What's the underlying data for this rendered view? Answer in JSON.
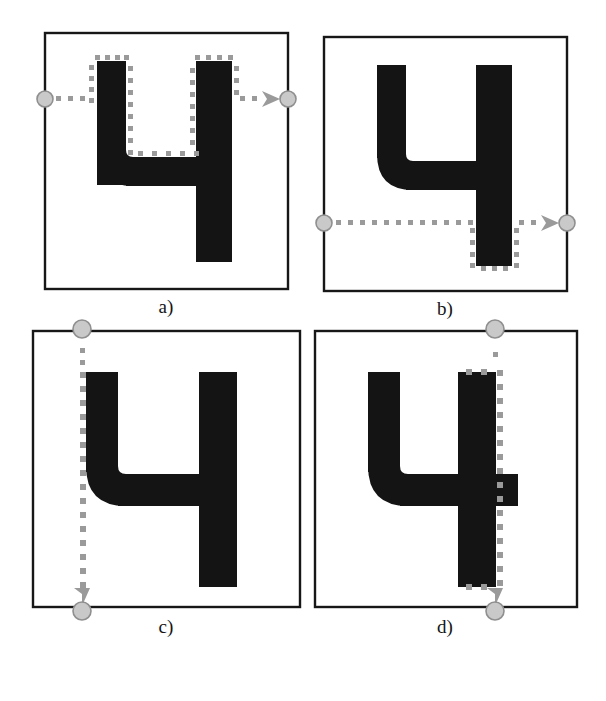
{
  "figure": {
    "type": "multi-panel-diagram",
    "panel_count": 4,
    "colors": {
      "ink": "#141414",
      "box_border": "#171717",
      "trace_dot": "#9a9a9a",
      "marker_fill": "#c9c9c9",
      "marker_stroke": "#8f8f8f",
      "background": "#ffffff"
    }
  },
  "panels": [
    {
      "id": "a",
      "label": "a)",
      "box": {
        "x": 45,
        "y": 33,
        "w": 243,
        "h": 256
      },
      "digit": "4",
      "scan": {
        "orientation": "horizontal",
        "direction": "right",
        "line_y": 99,
        "start_marker": {
          "x": 45,
          "y": 99
        },
        "end_marker": {
          "x": 288,
          "y": 99
        },
        "arrow_at": {
          "x": 272,
          "y": 99
        }
      },
      "contour_dots": "outlines the inner u-shaped cavity of the digit: left stem outer edge, stem top, inner right side, inner bottom, right stem left edge"
    },
    {
      "id": "b",
      "label": "b)",
      "box": {
        "x": 324,
        "y": 37,
        "w": 243,
        "h": 254
      },
      "digit": "4",
      "scan": {
        "orientation": "horizontal",
        "direction": "right",
        "line_y": 223,
        "start_marker": {
          "x": 324,
          "y": 223
        },
        "end_marker": {
          "x": 567,
          "y": 223
        },
        "arrow_at": {
          "x": 551,
          "y": 223
        }
      },
      "contour_dots": "traces both vertical sides and the bottom edge of the right stem below the scan line"
    },
    {
      "id": "c",
      "label": "c)",
      "box": {
        "x": 33,
        "y": 331,
        "w": 267,
        "h": 276
      },
      "digit": "4",
      "scan": {
        "orientation": "vertical",
        "direction": "down",
        "line_x": 82,
        "start_marker": {
          "x": 82,
          "y": 331
        },
        "end_marker": {
          "x": 82,
          "y": 607
        },
        "arrow_at": {
          "x": 82,
          "y": 593
        }
      },
      "contour_dots": "traces the left outer edge of the left stem and the curved bottom-left of the digit"
    },
    {
      "id": "d",
      "label": "d)",
      "box": {
        "x": 315,
        "y": 331,
        "w": 262,
        "h": 276
      },
      "digit": "4",
      "scan": {
        "orientation": "vertical",
        "direction": "down",
        "line_x": 495,
        "start_marker": {
          "x": 495,
          "y": 331
        },
        "end_marker": {
          "x": 495,
          "y": 607
        },
        "arrow_at": {
          "x": 495,
          "y": 593
        }
      },
      "contour_dots": "traces the full right outer edge of the right stem, from its top to its bottom corner"
    }
  ],
  "labels": {
    "a": "a)",
    "b": "b)",
    "c": "c)",
    "d": "d)"
  },
  "label_positions": [
    {
      "x": 126,
      "y": 296
    },
    {
      "x": 405,
      "y": 298
    },
    {
      "x": 126,
      "y": 616
    },
    {
      "x": 405,
      "y": 616
    }
  ]
}
